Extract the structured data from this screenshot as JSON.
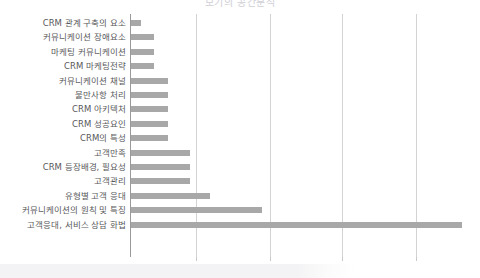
{
  "chart_data": {
    "type": "bar",
    "orientation": "horizontal",
    "title": "보기의 공간분석",
    "xlabel": "",
    "ylabel": "",
    "grid": true,
    "legend": false,
    "axis_x_positions_px": [
      196,
      270,
      342,
      416
    ],
    "categories": [
      "CRM 관계 구축의 요소",
      "커뮤니케이션 장애요소",
      "마케팅 커뮤니케이션",
      "CRM 마케팅전략",
      "커뮤니케이션 채널",
      "불만사항 처리",
      "CRM 아키텍처",
      "CRM 성공요인",
      "CRM의 특성",
      "고객만족",
      "CRM 등장배경, 필요성",
      "고객관리",
      "유형별 고객 응대",
      "커뮤니케이션의 원칙 및 특징",
      "고객응대, 서비스 상담 화법"
    ],
    "values": [
      10,
      23,
      23,
      23,
      37,
      37,
      37,
      37,
      37,
      59,
      59,
      59,
      79,
      131,
      331
    ],
    "xlim": [
      0,
      345
    ],
    "bar_color": "#a8a8a8",
    "gridline_color": "#d3d3d3",
    "axis_color": "#9a9a9a",
    "label_color": "#58585a"
  }
}
